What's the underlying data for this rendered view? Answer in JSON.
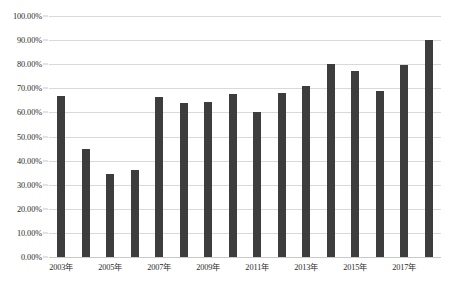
{
  "chart_data": {
    "type": "bar",
    "title": "",
    "subtitle": "",
    "xlabel": "",
    "ylabel": "",
    "legend": [],
    "legend_position": "none",
    "grid": true,
    "ylim": [
      0,
      100
    ],
    "ytick_labels": [
      "100.00%",
      "90.00%",
      "80.00%",
      "70.00%",
      "60.00%",
      "50.00%",
      "40.00%",
      "30.00%",
      "20.00%",
      "10.00%",
      "0.00%"
    ],
    "ytick_values": [
      100,
      90,
      80,
      70,
      60,
      50,
      40,
      30,
      20,
      10,
      0
    ],
    "categories": [
      "2003年",
      "2004年",
      "2005年",
      "2006年",
      "2007年",
      "2008年",
      "2009年",
      "2010年",
      "2011年",
      "2012年",
      "2013年",
      "2014年",
      "2015年",
      "2016年",
      "2017年",
      "2018年"
    ],
    "xtick_labels": [
      "2003年",
      "2005年",
      "2007年",
      "2009年",
      "2011年",
      "2013年",
      "2015年",
      "2017年"
    ],
    "xtick_indices": [
      0,
      2,
      4,
      6,
      8,
      10,
      12,
      14
    ],
    "values": [
      67.0,
      45.0,
      34.5,
      36.0,
      66.5,
      64.0,
      64.5,
      67.5,
      60.0,
      68.0,
      71.0,
      80.0,
      77.0,
      69.0,
      79.5,
      90.0
    ],
    "bar_color": "#3d3d3d",
    "grid_color": "#d9d9d9",
    "background_color": "#ffffff",
    "text_color": "#2b2b2b"
  }
}
